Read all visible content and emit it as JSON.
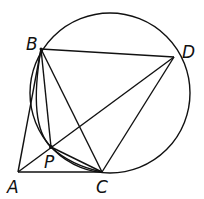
{
  "diagram": {
    "points": {
      "A": {
        "label": "A",
        "x": 18,
        "y": 172
      },
      "B": {
        "label": "B",
        "x": 41,
        "y": 49
      },
      "C": {
        "label": "C",
        "x": 102,
        "y": 172
      },
      "D": {
        "label": "D",
        "x": 174,
        "y": 57
      },
      "P": {
        "label": "P",
        "x": 51,
        "y": 147
      }
    },
    "segments": [
      "AB",
      "AC",
      "AD",
      "BD",
      "BC",
      "BP",
      "PC",
      "CD"
    ],
    "circle": {
      "through": [
        "B",
        "C",
        "D"
      ],
      "cx": 110,
      "cy": 93,
      "r": 80
    },
    "inner_arc": {
      "through": [
        "B",
        "P",
        "C"
      ]
    },
    "stroke_color": "#111111"
  }
}
